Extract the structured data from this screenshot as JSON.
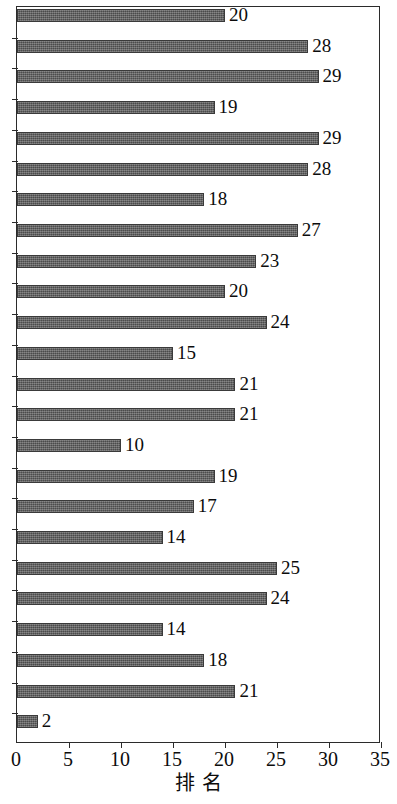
{
  "chart_data": {
    "type": "bar",
    "orientation": "horizontal",
    "title": "",
    "xlabel": "排 名",
    "ylabel": "",
    "xlim": [
      0,
      35
    ],
    "xticks": [
      0,
      5,
      10,
      15,
      20,
      25,
      30,
      35
    ],
    "xtick_labels": [
      "0",
      "5",
      "10",
      "15",
      "20",
      "25",
      "30",
      "35"
    ],
    "grid": false,
    "legend": null,
    "categories": [
      "1",
      "2",
      "3",
      "4",
      "5",
      "6",
      "7",
      "8",
      "9",
      "10",
      "11",
      "12",
      "13",
      "14",
      "15",
      "16",
      "17",
      "18",
      "19",
      "20",
      "21",
      "22",
      "23",
      "24"
    ],
    "ytick_labels": [],
    "values": [
      20,
      28,
      29,
      19,
      29,
      28,
      18,
      27,
      23,
      20,
      24,
      15,
      21,
      21,
      10,
      19,
      17,
      14,
      25,
      24,
      14,
      18,
      21,
      2
    ],
    "data_labels": [
      "20",
      "28",
      "29",
      "19",
      "29",
      "28",
      "18",
      "27",
      "23",
      "20",
      "24",
      "15",
      "21",
      "21",
      "10",
      "19",
      "17",
      "14",
      "25",
      "24",
      "14",
      "18",
      "21",
      "2"
    ],
    "bar_color": "#5a5a5a",
    "bar_edge_color": "#3a3a3a",
    "axis_color": "#2b2b2b",
    "background_color": "#ffffff"
  }
}
